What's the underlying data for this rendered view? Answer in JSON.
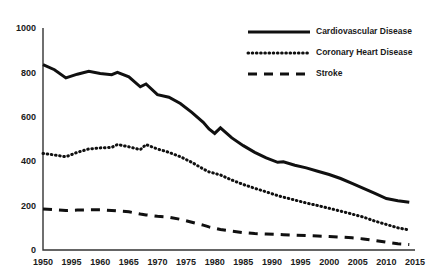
{
  "chart_data": {
    "type": "line",
    "title": "",
    "xlabel": "",
    "ylabel": "",
    "xlim": [
      1950,
      2015
    ],
    "ylim": [
      0,
      1000
    ],
    "grid": false,
    "legend_position": "top-right",
    "ytick_labels": [
      "1000",
      "800",
      "600",
      "400",
      "200",
      "0"
    ],
    "ytick_values": [
      1000,
      800,
      600,
      400,
      200,
      0
    ],
    "xtick_labels": [
      "1950",
      "1995",
      "1960",
      "1965",
      "1970",
      "1975",
      "1980",
      "1985",
      "1990",
      "1995",
      "2000",
      "2005",
      "2010",
      "2015"
    ],
    "xtick_values": [
      1950,
      1955,
      1960,
      1965,
      1970,
      1975,
      1980,
      1985,
      1990,
      1995,
      2000,
      2005,
      2010,
      2015
    ],
    "x": [
      1950,
      1952,
      1954,
      1956,
      1958,
      1960,
      1962,
      1963,
      1965,
      1967,
      1968,
      1970,
      1972,
      1974,
      1976,
      1978,
      1979,
      1980,
      1981,
      1983,
      1985,
      1987,
      1989,
      1991,
      1992,
      1994,
      1996,
      1998,
      2000,
      2002,
      2004,
      2006,
      2008,
      2010,
      2012,
      2014
    ],
    "series": [
      {
        "name": "Cardiovascular Disease",
        "style": "solid",
        "color": "#101010",
        "values": [
          835,
          812,
          775,
          792,
          805,
          795,
          790,
          800,
          780,
          735,
          748,
          700,
          688,
          660,
          620,
          575,
          545,
          525,
          550,
          505,
          470,
          440,
          415,
          395,
          397,
          382,
          370,
          355,
          340,
          322,
          300,
          278,
          255,
          232,
          222,
          215
        ]
      },
      {
        "name": "Coronary Heart Disease",
        "style": "dotted",
        "color": "#101010",
        "values": [
          435,
          428,
          420,
          440,
          455,
          460,
          462,
          475,
          465,
          452,
          475,
          455,
          440,
          420,
          395,
          365,
          352,
          345,
          338,
          315,
          295,
          278,
          262,
          245,
          238,
          225,
          212,
          200,
          188,
          175,
          162,
          148,
          130,
          115,
          100,
          90
        ]
      },
      {
        "name": "Stroke",
        "style": "dashed",
        "color": "#101010",
        "values": [
          185,
          182,
          178,
          180,
          181,
          181,
          178,
          176,
          172,
          162,
          158,
          152,
          148,
          138,
          125,
          112,
          104,
          98,
          92,
          85,
          78,
          74,
          72,
          70,
          69,
          67,
          65,
          63,
          61,
          58,
          55,
          50,
          43,
          35,
          28,
          25
        ]
      }
    ]
  },
  "legend": {
    "items": [
      {
        "label": "Cardiovascular Disease",
        "style": "solid"
      },
      {
        "label": "Coronary Heart Disease",
        "style": "dotted"
      },
      {
        "label": "Stroke",
        "style": "dashed"
      }
    ]
  }
}
